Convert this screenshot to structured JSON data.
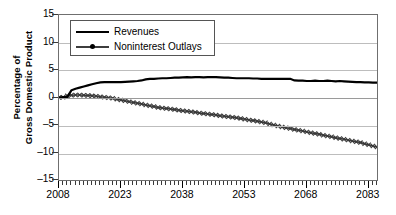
{
  "chart_data": {
    "type": "line",
    "title": "",
    "xlabel": "",
    "ylabel": "Percentage of Gross Domestic Product",
    "ylabel_lines": [
      "Percentage of",
      "Gross Domestic Product"
    ],
    "ylim": [
      -15,
      15
    ],
    "xlim": [
      2008,
      2085
    ],
    "yticks": [
      15,
      10,
      5,
      0,
      -5,
      -10,
      -15
    ],
    "ytick_labels": [
      "15",
      "10",
      "5",
      "0",
      "–15",
      "–5",
      "–10"
    ],
    "ytick_labels_ordered": [
      "15",
      "10",
      "5",
      "0",
      "–5",
      "–10",
      "–15"
    ],
    "xticks": [
      2008,
      2023,
      2038,
      2053,
      2068,
      2083
    ],
    "xtick_labels": [
      "2008",
      "2023",
      "2038",
      "2053",
      "2068",
      "2083"
    ],
    "minor_xtick_interval": 1,
    "grid": "horizontal",
    "legend_position": "upper-left-inside",
    "series": [
      {
        "name": "Revenues",
        "marker": "none",
        "color": "#000000",
        "x": [
          2008,
          2009,
          2010,
          2011,
          2012,
          2013,
          2014,
          2015,
          2016,
          2017,
          2018,
          2019,
          2020,
          2021,
          2022,
          2023,
          2024,
          2025,
          2026,
          2027,
          2028,
          2029,
          2030,
          2031,
          2032,
          2033,
          2034,
          2035,
          2036,
          2037,
          2038,
          2039,
          2040,
          2041,
          2042,
          2043,
          2044,
          2045,
          2046,
          2047,
          2048,
          2049,
          2050,
          2051,
          2052,
          2053,
          2054,
          2055,
          2056,
          2057,
          2058,
          2059,
          2060,
          2061,
          2062,
          2063,
          2064,
          2065,
          2066,
          2067,
          2068,
          2069,
          2070,
          2071,
          2072,
          2073,
          2074,
          2075,
          2076,
          2077,
          2078,
          2079,
          2080,
          2081,
          2082,
          2083,
          2084,
          2085
        ],
        "values": [
          0.0,
          0.05,
          0.1,
          1.3,
          1.6,
          1.8,
          2.0,
          2.2,
          2.4,
          2.6,
          2.75,
          2.8,
          2.8,
          2.8,
          2.8,
          2.8,
          2.85,
          2.9,
          2.95,
          3.0,
          3.1,
          3.3,
          3.4,
          3.4,
          3.45,
          3.5,
          3.5,
          3.55,
          3.6,
          3.6,
          3.65,
          3.7,
          3.65,
          3.7,
          3.7,
          3.65,
          3.7,
          3.7,
          3.7,
          3.65,
          3.6,
          3.6,
          3.55,
          3.5,
          3.5,
          3.5,
          3.5,
          3.45,
          3.45,
          3.4,
          3.4,
          3.4,
          3.4,
          3.4,
          3.4,
          3.4,
          3.4,
          3.1,
          3.05,
          3.05,
          3.0,
          3.0,
          3.05,
          3.0,
          3.0,
          3.05,
          3.0,
          2.95,
          3.0,
          2.95,
          2.9,
          2.85,
          2.8,
          2.8,
          2.75,
          2.75,
          2.7,
          2.7
        ]
      },
      {
        "name": "Noninterest Outlays",
        "marker": "cross-dot",
        "color": "#3a3a3a",
        "x": [
          2008,
          2009,
          2010,
          2011,
          2012,
          2013,
          2014,
          2015,
          2016,
          2017,
          2018,
          2019,
          2020,
          2021,
          2022,
          2023,
          2024,
          2025,
          2026,
          2027,
          2028,
          2029,
          2030,
          2031,
          2032,
          2033,
          2034,
          2035,
          2036,
          2037,
          2038,
          2039,
          2040,
          2041,
          2042,
          2043,
          2044,
          2045,
          2046,
          2047,
          2048,
          2049,
          2050,
          2051,
          2052,
          2053,
          2054,
          2055,
          2056,
          2057,
          2058,
          2059,
          2060,
          2061,
          2062,
          2063,
          2064,
          2065,
          2066,
          2067,
          2068,
          2069,
          2070,
          2071,
          2072,
          2073,
          2074,
          2075,
          2076,
          2077,
          2078,
          2079,
          2080,
          2081,
          2082,
          2083,
          2084,
          2085
        ],
        "values": [
          0.0,
          0.05,
          0.3,
          0.4,
          0.45,
          0.45,
          0.4,
          0.35,
          0.3,
          0.25,
          0.15,
          0.05,
          -0.05,
          -0.15,
          -0.3,
          -0.45,
          -0.6,
          -0.75,
          -0.9,
          -1.05,
          -1.2,
          -1.35,
          -1.5,
          -1.65,
          -1.8,
          -1.9,
          -2.0,
          -2.1,
          -2.2,
          -2.3,
          -2.4,
          -2.5,
          -2.6,
          -2.7,
          -2.8,
          -2.9,
          -3.0,
          -3.1,
          -3.2,
          -3.3,
          -3.4,
          -3.5,
          -3.6,
          -3.7,
          -3.8,
          -3.95,
          -4.1,
          -4.2,
          -4.3,
          -4.45,
          -4.6,
          -4.8,
          -5.0,
          -5.2,
          -5.35,
          -5.5,
          -5.65,
          -5.8,
          -5.95,
          -6.1,
          -6.25,
          -6.4,
          -6.55,
          -6.7,
          -6.85,
          -7.0,
          -7.15,
          -7.3,
          -7.45,
          -7.6,
          -7.75,
          -7.9,
          -8.05,
          -8.2,
          -8.4,
          -8.6,
          -8.8,
          -9.0
        ]
      }
    ]
  },
  "legend": {
    "items": [
      {
        "label": "Revenues"
      },
      {
        "label": "Noninterest Outlays"
      }
    ]
  }
}
